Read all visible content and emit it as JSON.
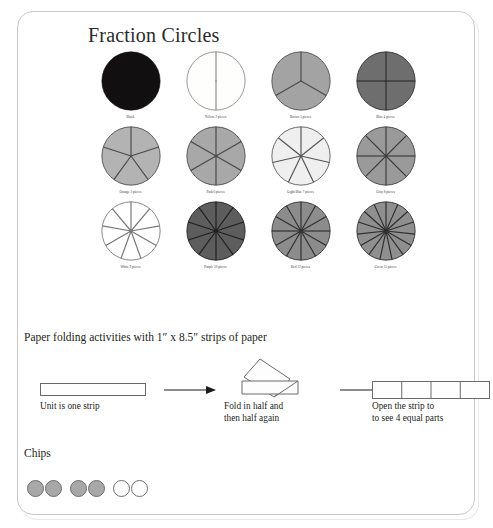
{
  "sheet": {
    "title": "Fraction Circles"
  },
  "circles": {
    "rows": [
      [
        {
          "label": "Black",
          "color_name": "Black",
          "pieces": 1,
          "fill": "#110f0f",
          "stroke": "#110f0f",
          "label_text": "Black"
        },
        {
          "label": "Yellow 2 pieces",
          "color_name": "Yellow",
          "pieces": 2,
          "fill": "#fefefd",
          "stroke": "#8a8a8a",
          "label_text": "Yellow 2 pieces"
        },
        {
          "label": "Brown 3 pieces",
          "color_name": "Brown",
          "pieces": 3,
          "fill": "#a3a3a3",
          "stroke": "#4c4c4c",
          "label_text": "Brown 3 pieces"
        },
        {
          "label": "Blue 4 pieces",
          "color_name": "Blue",
          "pieces": 4,
          "fill": "#6e6e6e",
          "stroke": "#2f2f2f",
          "label_text": "Blue 4 pieces"
        }
      ],
      [
        {
          "label": "Orange 5 pieces",
          "color_name": "Orange",
          "pieces": 5,
          "fill": "#b3b3b3",
          "stroke": "#4a4a4a",
          "label_text": "Orange 5 pieces"
        },
        {
          "label": "Pink 6 pieces",
          "color_name": "Pink",
          "pieces": 6,
          "fill": "#a8a8a8",
          "stroke": "#474747",
          "label_text": "Pink 6 pieces"
        },
        {
          "label": "Light Blue 7 pieces",
          "color_name": "Light Blue",
          "pieces": 7,
          "fill": "#efefef",
          "stroke": "#555555",
          "label_text": "Light Blue 7 pieces"
        },
        {
          "label": "Gray 8 pieces",
          "color_name": "Gray",
          "pieces": 8,
          "fill": "#9a9a9a",
          "stroke": "#3d3d3d",
          "label_text": "Gray 8 pieces"
        }
      ],
      [
        {
          "label": "White 9 pieces",
          "color_name": "White",
          "pieces": 9,
          "fill": "#ffffff",
          "stroke": "#777777",
          "label_text": "White 9 pieces"
        },
        {
          "label": "Purple 10 pieces",
          "color_name": "Purple",
          "pieces": 10,
          "fill": "#5d5d5d",
          "stroke": "#1f1f1f",
          "label_text": "Purple 10 pieces"
        },
        {
          "label": "Red 12 pieces",
          "color_name": "Red",
          "pieces": 12,
          "fill": "#8c8c8c",
          "stroke": "#303030",
          "label_text": "Red 12 pieces"
        },
        {
          "label": "Green 15 pieces",
          "color_name": "Green",
          "pieces": 15,
          "fill": "#8f8f8f",
          "stroke": "#2e2e2e",
          "label_text": "Green 15 pieces"
        }
      ]
    ]
  },
  "paper_folding": {
    "heading": "Paper folding activities with 1″ x 8.5″ strips of paper",
    "steps": [
      {
        "caption_line1": "Unit is one strip",
        "caption_line2": "",
        "parts": 1
      },
      {
        "caption_line1": "Fold in half and",
        "caption_line2": "then half again",
        "parts": 1
      },
      {
        "caption_line1": "Open the strip to",
        "caption_line2": "to see 4 equal parts",
        "parts": 4
      }
    ]
  },
  "chips": {
    "heading": "Chips",
    "items": [
      {
        "fill": "#a8a8a8",
        "stroke": "#6d6d6d"
      },
      {
        "fill": "#a8a8a8",
        "stroke": "#6d6d6d"
      },
      {
        "fill": "#a8a8a8",
        "stroke": "#6d6d6d"
      },
      {
        "fill": "#a8a8a8",
        "stroke": "#6d6d6d"
      },
      {
        "fill": "#ffffff",
        "stroke": "#6d6d6d"
      },
      {
        "fill": "#ffffff",
        "stroke": "#6d6d6d"
      }
    ]
  },
  "colors": {
    "page_background": "#ffffff",
    "sheet_border": "#c9c9c9",
    "text": "#231f20"
  }
}
